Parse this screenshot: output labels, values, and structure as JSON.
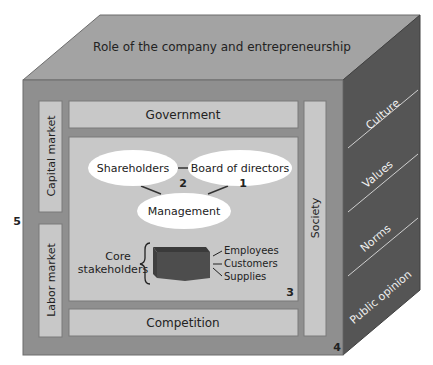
{
  "top_face": {
    "label": "Role of the company and entrepreneurship"
  },
  "side_face": {
    "items": [
      "Culture",
      "Values",
      "Norms",
      "Public opinion"
    ]
  },
  "front": {
    "left_column": [
      "Capital market",
      "Labor market"
    ],
    "right_column": "Society",
    "top_bar": "Government",
    "bottom_bar": "Competition"
  },
  "core": {
    "nodes": [
      "Shareholders",
      "Board of directors",
      "Management"
    ],
    "stakeholders_label_1": "Core",
    "stakeholders_label_2": "stakeholders",
    "stakeholders_list": [
      "Employees",
      "Customers",
      "Supplies"
    ]
  },
  "markers": {
    "m1": "1",
    "m2": "2",
    "m3": "3",
    "m4": "4",
    "m5": "5"
  },
  "colors": {
    "top": "#a3a3a3",
    "front": "#8f8f8f",
    "panel": "#c8c8c8",
    "side": "#555555",
    "ellipse": "#ffffff",
    "box": "#4d4d4d"
  }
}
